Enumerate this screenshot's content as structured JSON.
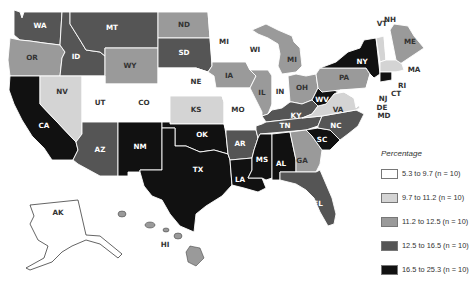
{
  "legend": {
    "title": "Percentage",
    "bins": [
      {
        "label": "5.3 to 9.7 (n = 10)",
        "color": "#ffffff"
      },
      {
        "label": "9.7 to 11.2 (n = 10)",
        "color": "#d4d4d4"
      },
      {
        "label": "11.2 to 12.5 (n = 10)",
        "color": "#9a9a9a"
      },
      {
        "label": "12.5 to 16.5 (n = 10)",
        "color": "#555555"
      },
      {
        "label": "16.5 to 25.3 (n = 10)",
        "color": "#111111"
      }
    ]
  },
  "states": {
    "WA": {
      "label": "WA",
      "bin": 3
    },
    "OR": {
      "label": "OR",
      "bin": 2
    },
    "CA": {
      "label": "CA",
      "bin": 4
    },
    "ID": {
      "label": "ID",
      "bin": 3
    },
    "NV": {
      "label": "NV",
      "bin": 1
    },
    "MT": {
      "label": "MT",
      "bin": 3
    },
    "WY": {
      "label": "WY",
      "bin": 2
    },
    "UT": {
      "label": "UT",
      "bin": 0
    },
    "CO": {
      "label": "CO",
      "bin": 0
    },
    "AZ": {
      "label": "AZ",
      "bin": 3
    },
    "NM": {
      "label": "NM",
      "bin": 4
    },
    "ND": {
      "label": "ND",
      "bin": 2
    },
    "SD": {
      "label": "SD",
      "bin": 3
    },
    "NE": {
      "label": "NE",
      "bin": 0
    },
    "KS": {
      "label": "KS",
      "bin": 1
    },
    "OK": {
      "label": "OK",
      "bin": 4
    },
    "TX": {
      "label": "TX",
      "bin": 4
    },
    "MN": {
      "label": "MI",
      "bin": 0
    },
    "IA": {
      "label": "IA",
      "bin": 2
    },
    "MO": {
      "label": "MO",
      "bin": 0
    },
    "AR": {
      "label": "AR",
      "bin": 3
    },
    "LA": {
      "label": "LA",
      "bin": 4
    },
    "WI": {
      "label": "WI",
      "bin": 0
    },
    "IL": {
      "label": "IL",
      "bin": 2
    },
    "MS": {
      "label": "MS",
      "bin": 4
    },
    "MI": {
      "label": "MI",
      "bin": 2
    },
    "IN": {
      "label": "IN",
      "bin": 0
    },
    "KY": {
      "label": "KY",
      "bin": 3
    },
    "TN": {
      "label": "TN",
      "bin": 3
    },
    "AL": {
      "label": "AL",
      "bin": 4
    },
    "OH": {
      "label": "OH",
      "bin": 2
    },
    "GA": {
      "label": "GA",
      "bin": 2
    },
    "FL": {
      "label": "FL",
      "bin": 3
    },
    "SC": {
      "label": "SC",
      "bin": 4
    },
    "NC": {
      "label": "NC",
      "bin": 3
    },
    "VA": {
      "label": "VA",
      "bin": 1
    },
    "WV": {
      "label": "WV",
      "bin": 4
    },
    "PA": {
      "label": "PA",
      "bin": 2
    },
    "NY": {
      "label": "NY",
      "bin": 4
    },
    "VT": {
      "label": "VT",
      "bin": 1
    },
    "NH": {
      "label": "NH",
      "bin": 0
    },
    "ME": {
      "label": "ME",
      "bin": 2
    },
    "MA": {
      "label": "MA",
      "bin": 1
    },
    "RI": {
      "label": "RI",
      "bin": 0
    },
    "CT": {
      "label": "CT",
      "bin": 4
    },
    "NJ": {
      "label": "NJ",
      "bin": 0
    },
    "DE": {
      "label": "DE",
      "bin": 0
    },
    "MD": {
      "label": "MD",
      "bin": 0
    },
    "AK": {
      "label": "AK",
      "bin": 0
    },
    "HI": {
      "label": "HI",
      "bin": 2
    }
  }
}
